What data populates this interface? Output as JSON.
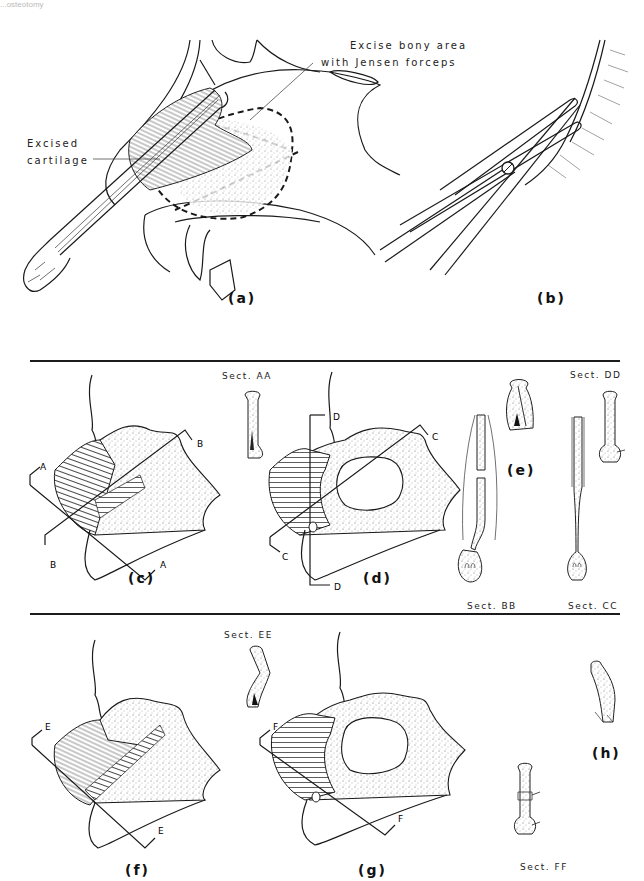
{
  "page": {
    "header_fragment": "...osteotomy"
  },
  "figure_a": {
    "caption": "(a)",
    "label_excise_line1": "Excise bony area",
    "label_excise_line2": "with Jensen forceps",
    "label_cartilage_line1": "Excised",
    "label_cartilage_line2": "cartilage"
  },
  "figure_b": {
    "caption": "(b)"
  },
  "figure_c": {
    "caption": "(c)",
    "section_label": "Sect. AA",
    "cut_markers": [
      "A",
      "A",
      "B",
      "B"
    ]
  },
  "figure_d": {
    "caption": "(d)",
    "cut_markers": [
      "C",
      "C",
      "D",
      "D"
    ]
  },
  "figure_e": {
    "caption": "(e)",
    "section_label_top": "Sect. DD",
    "section_label_bb": "Sect. BB",
    "section_label_cc": "Sect. CC"
  },
  "figure_f": {
    "caption": "(f)",
    "section_label": "Sect. EE",
    "cut_markers": [
      "E",
      "E"
    ]
  },
  "figure_g": {
    "caption": "(g)",
    "cut_markers": [
      "F",
      "F"
    ]
  },
  "figure_h": {
    "caption": "(h)",
    "section_label": "Sect. FF"
  },
  "colors": {
    "ink": "#1a1a1a",
    "paper": "#ffffff"
  }
}
